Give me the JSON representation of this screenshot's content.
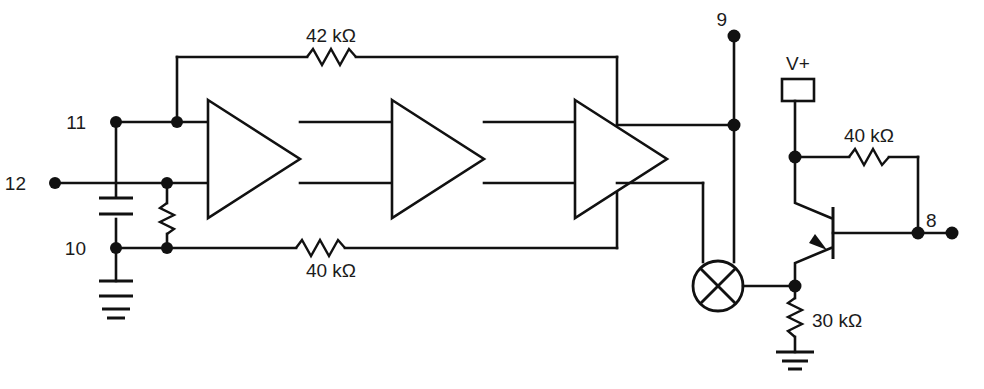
{
  "diagram": {
    "line_color": "#111111",
    "background": "#ffffff"
  },
  "pins": [
    {
      "id": "pin-11",
      "label": "11"
    },
    {
      "id": "pin-12",
      "label": "12"
    },
    {
      "id": "pin-10",
      "label": "10"
    },
    {
      "id": "pin-9",
      "label": "9"
    },
    {
      "id": "pin-8",
      "label": "8"
    }
  ],
  "components": {
    "resistor_feedback_top": {
      "label": "42 kΩ"
    },
    "resistor_feedback_bottom": {
      "label": "40 kΩ"
    },
    "resistor_collector": {
      "label": "40 kΩ"
    },
    "resistor_emitter": {
      "label": "30 kΩ"
    },
    "supply_box": {
      "label": "V+"
    },
    "amplifiers": [
      {
        "id": "amplifier-stage-1",
        "label": ""
      },
      {
        "id": "amplifier-stage-2",
        "label": ""
      },
      {
        "id": "amplifier-stage-3",
        "label": ""
      }
    ],
    "lamp": {
      "id": "lamp-symbol",
      "label": ""
    },
    "transistor": {
      "id": "transistor-symbol",
      "label": ""
    },
    "capacitor_input": {
      "id": "capacitor-input",
      "label": ""
    },
    "resistor_input_shunt": {
      "id": "resistor-input-shunt",
      "label": ""
    },
    "ground_left": {
      "id": "ground-left",
      "label": ""
    },
    "ground_right": {
      "id": "ground-right",
      "label": ""
    }
  }
}
